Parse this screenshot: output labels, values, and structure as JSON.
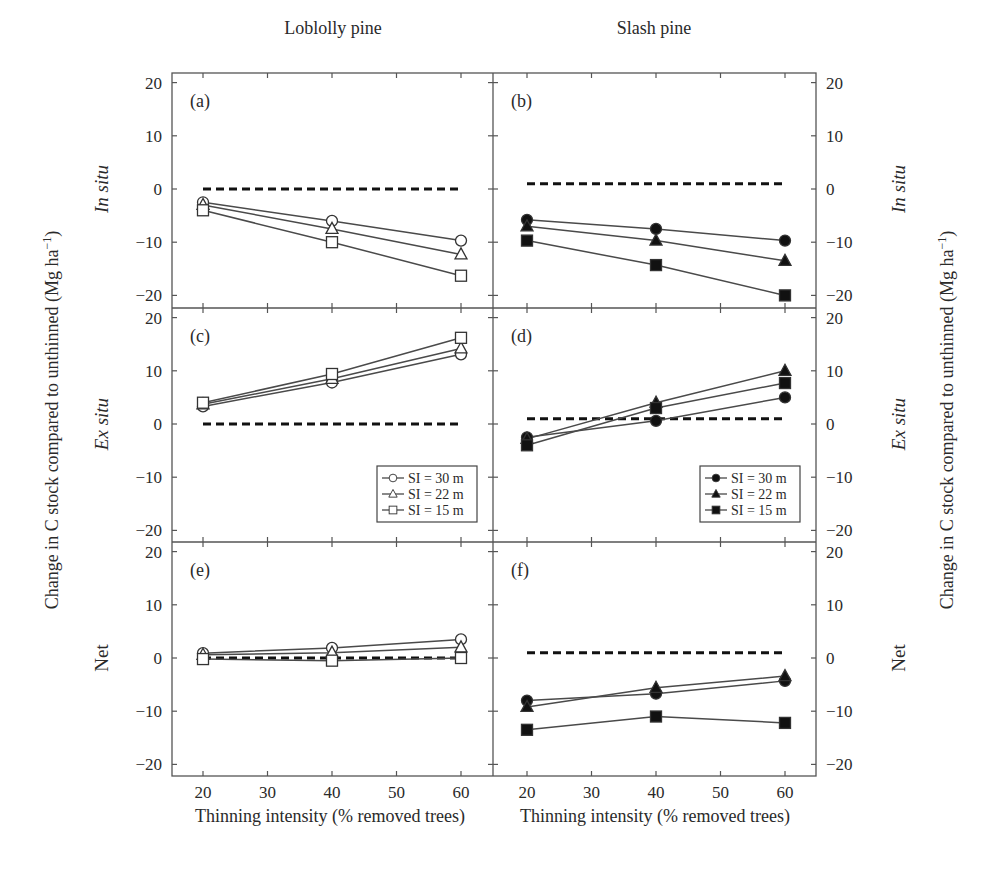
{
  "figure": {
    "column_titles": [
      "Loblolly pine",
      "Slash pine"
    ],
    "row_labels": [
      {
        "text": "In situ",
        "italic": true
      },
      {
        "text": "Ex situ",
        "italic": true
      },
      {
        "text": "Net",
        "italic": false
      }
    ],
    "y_axis_title": "Change in C stock compared to unthinned (Mg ha",
    "y_axis_title_superscript": "−1",
    "y_axis_title_close": ")",
    "x_axis_title": "Thinning intensity (% removed trees)",
    "x_ticks": [
      20,
      30,
      40,
      50,
      60
    ],
    "y_ticks": [
      20,
      10,
      0,
      -10,
      -20
    ],
    "y_tick_labels": [
      "20",
      "10",
      "0",
      "−10",
      "−20"
    ],
    "legend_loblolly": [
      "SI = 30 m",
      "SI = 22 m",
      "SI = 15 m"
    ],
    "legend_slash": [
      "SI = 30 m",
      "SI = 22 m",
      "SI = 15 m"
    ]
  },
  "chart_data": [
    {
      "panel": "(a)",
      "type": "line",
      "species": "Loblolly pine",
      "component": "In situ",
      "x": [
        20,
        40,
        60
      ],
      "xlabel": "Thinning intensity (% removed trees)",
      "ylabel": "Change in C stock compared to unthinned (Mg ha−1)",
      "xlim": [
        15,
        65
      ],
      "ylim": [
        -22,
        22
      ],
      "grid": false,
      "reference_line": 0,
      "markers": "open",
      "series": [
        {
          "name": "SI = 30 m",
          "marker": "circle",
          "values": [
            -2.5,
            -6,
            -9.7
          ]
        },
        {
          "name": "SI = 22 m",
          "marker": "triangle",
          "values": [
            -3,
            -7.5,
            -12.3
          ]
        },
        {
          "name": "SI = 15 m",
          "marker": "square",
          "values": [
            -4,
            -10,
            -16.3
          ]
        }
      ]
    },
    {
      "panel": "(b)",
      "type": "line",
      "species": "Slash pine",
      "component": "In situ",
      "x": [
        20,
        40,
        60
      ],
      "xlim": [
        15,
        65
      ],
      "ylim": [
        -22,
        22
      ],
      "grid": false,
      "reference_line": 1,
      "markers": "filled",
      "series": [
        {
          "name": "SI = 30 m",
          "marker": "circle",
          "values": [
            -5.8,
            -7.5,
            -9.7
          ]
        },
        {
          "name": "SI = 22 m",
          "marker": "triangle",
          "values": [
            -7,
            -9.7,
            -13.5
          ]
        },
        {
          "name": "SI = 15 m",
          "marker": "square",
          "values": [
            -9.7,
            -14.3,
            -20
          ]
        }
      ]
    },
    {
      "panel": "(c)",
      "type": "line",
      "species": "Loblolly pine",
      "component": "Ex situ",
      "x": [
        20,
        40,
        60
      ],
      "xlim": [
        15,
        65
      ],
      "ylim": [
        -22,
        22
      ],
      "grid": false,
      "reference_line": 0,
      "markers": "open",
      "legend_position": "lower right",
      "series": [
        {
          "name": "SI = 30 m",
          "marker": "circle",
          "values": [
            3.3,
            7.8,
            13.1
          ]
        },
        {
          "name": "SI = 22 m",
          "marker": "triangle",
          "values": [
            3.7,
            8.5,
            14.2
          ]
        },
        {
          "name": "SI = 15 m",
          "marker": "square",
          "values": [
            4.0,
            9.4,
            16.2
          ]
        }
      ]
    },
    {
      "panel": "(d)",
      "type": "line",
      "species": "Slash pine",
      "component": "Ex situ",
      "x": [
        20,
        40,
        60
      ],
      "xlim": [
        15,
        65
      ],
      "ylim": [
        -22,
        22
      ],
      "grid": false,
      "reference_line": 1,
      "markers": "filled",
      "legend_position": "lower right",
      "series": [
        {
          "name": "SI = 30 m",
          "marker": "circle",
          "values": [
            -2.5,
            0.6,
            5.0
          ]
        },
        {
          "name": "SI = 22 m",
          "marker": "triangle",
          "values": [
            -2.8,
            4.0,
            10.0
          ]
        },
        {
          "name": "SI = 15 m",
          "marker": "square",
          "values": [
            -4.0,
            3.0,
            7.7
          ]
        }
      ]
    },
    {
      "panel": "(e)",
      "type": "line",
      "species": "Loblolly pine",
      "component": "Net",
      "x": [
        20,
        40,
        60
      ],
      "xlim": [
        15,
        65
      ],
      "ylim": [
        -22,
        22
      ],
      "grid": false,
      "reference_line": 0,
      "markers": "open",
      "series": [
        {
          "name": "SI = 30 m",
          "marker": "circle",
          "values": [
            0.9,
            1.9,
            3.5
          ]
        },
        {
          "name": "SI = 22 m",
          "marker": "triangle",
          "values": [
            0.6,
            1.0,
            2.0
          ]
        },
        {
          "name": "SI = 15 m",
          "marker": "square",
          "values": [
            -0.2,
            -0.5,
            0.0
          ]
        }
      ]
    },
    {
      "panel": "(f)",
      "type": "line",
      "species": "Slash pine",
      "component": "Net",
      "x": [
        20,
        40,
        60
      ],
      "xlim": [
        15,
        65
      ],
      "ylim": [
        -22,
        22
      ],
      "grid": false,
      "reference_line": 1,
      "markers": "filled",
      "series": [
        {
          "name": "SI = 30 m",
          "marker": "circle",
          "values": [
            -8,
            -6.7,
            -4.3
          ]
        },
        {
          "name": "SI = 22 m",
          "marker": "triangle",
          "values": [
            -9.2,
            -5.6,
            -3.4
          ]
        },
        {
          "name": "SI = 15 m",
          "marker": "square",
          "values": [
            -13.5,
            -11,
            -12.2
          ]
        }
      ]
    }
  ],
  "colors": {
    "line": "#4a4a4a",
    "marker_fill_filled": "#111111",
    "marker_fill_open": "#ffffff",
    "axis": "#555555",
    "reference": "#111111"
  }
}
